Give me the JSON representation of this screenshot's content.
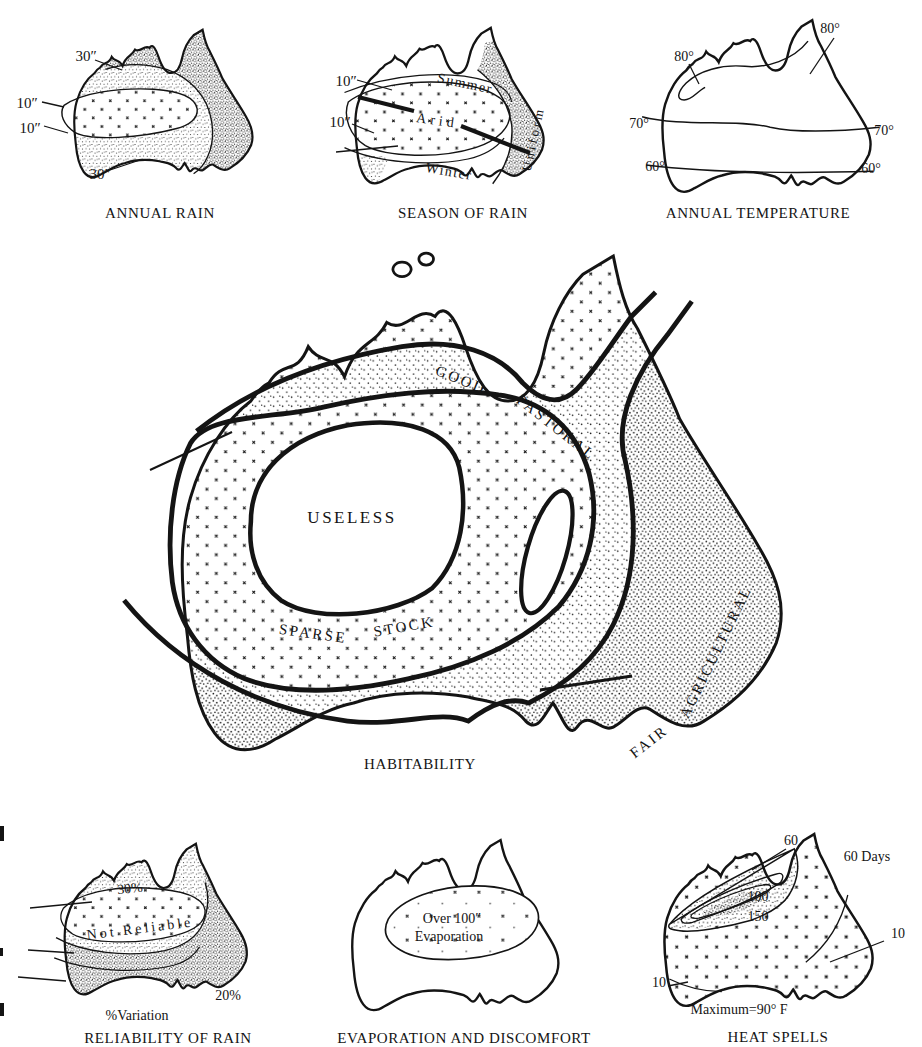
{
  "maps": {
    "annual_rain": {
      "caption": "ANNUAL RAIN",
      "labels": {
        "top_30": "30″",
        "left_10a": "10″",
        "left_10b": "10″",
        "bottom_30": "30″"
      }
    },
    "season_of_rain": {
      "caption": "SEASON OF RAIN",
      "labels": {
        "upper_10": "10″",
        "lower_10": "10″",
        "summer": "Summer",
        "arid": "Arid",
        "winter": "Winter",
        "uniform": "Uniform"
      }
    },
    "annual_temperature": {
      "caption": "ANNUAL TEMPERATURE",
      "labels": {
        "ne_80": "80°",
        "nw_80": "80°",
        "w_70": "70°",
        "e_70": "70°",
        "w_60": "60°",
        "e_60": "60°"
      }
    },
    "habitability": {
      "caption": "HABITABILITY",
      "labels": {
        "good": "GOOD",
        "pastoral": "PASTORAL",
        "useless": "USELESS",
        "sparse": "SPARSE",
        "stock": "STOCK",
        "fair": "FAIR",
        "agricultural": "AGRICULTURAL"
      }
    },
    "reliability_of_rain": {
      "caption": "RELIABILITY OF RAIN",
      "subcaption": "%Variation",
      "labels": {
        "pct_30": "30%",
        "not_reliable": "Not Reliable",
        "pct_20": "20%"
      }
    },
    "evaporation": {
      "caption": "EVAPORATION AND DISCOMFORT",
      "labels": {
        "over_line1": "Over 100″",
        "over_line2": "Evaporation"
      }
    },
    "heat_spells": {
      "caption": "HEAT SPELLS",
      "subcaption": "Maximum=90° F",
      "labels": {
        "d60": "60",
        "d60_days": "60 Days",
        "d100": "100",
        "d150": "150",
        "d10_east": "10",
        "d10_west": "10"
      }
    }
  },
  "ink_color": "#141414",
  "paper_color": "#ffffff"
}
